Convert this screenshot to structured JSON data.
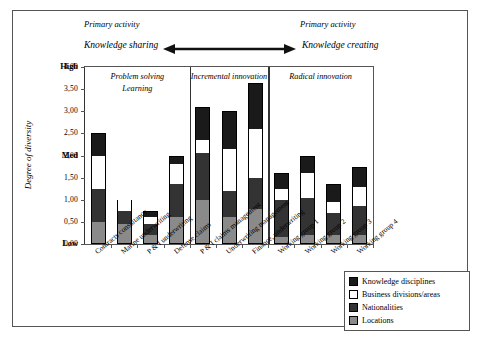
{
  "annotations": {
    "primary_activity_left": "Primary activity",
    "primary_activity_right": "Primary activity",
    "knowledge_sharing": "Knowledge sharing",
    "knowledge_creating": "Knowledge creating",
    "arrow_icon": "double-headed-arrow-icon"
  },
  "chart_data": {
    "type": "bar",
    "stacked": true,
    "title": "",
    "xlabel": "",
    "ylabel": "Degree of diversity",
    "ylim": [
      0,
      4
    ],
    "ytick_values": [
      "0,00",
      "0,50",
      "1,00",
      "1,50",
      "2,00",
      "2,50",
      "3,00",
      "3,50",
      "4,00"
    ],
    "qualitative_ticks": [
      {
        "label": "High",
        "value": 4.0
      },
      {
        "label": "Med",
        "value": 2.0
      },
      {
        "label": "Low",
        "value": 0.0
      }
    ],
    "grid": false,
    "legend_position": "bottom-right",
    "categories": [
      "Contracts consultancy",
      "Marine underwriting",
      "P & I underwriting",
      "Defense claims",
      "P & I claims management",
      "Underwriting management",
      "Finance, underwriting",
      "Working group 1",
      "Working group 2",
      "Working group 3",
      "Working group 4"
    ],
    "series": [
      {
        "name": "Locations",
        "color": "#8a8a8a",
        "values": [
          0.5,
          0.45,
          0.2,
          0.6,
          1.0,
          0.6,
          0.8,
          0.15,
          0.2,
          0.2,
          0.2
        ]
      },
      {
        "name": "Nationalities",
        "color": "#333333",
        "values": [
          0.75,
          0.3,
          0.25,
          0.75,
          1.05,
          0.6,
          0.7,
          0.85,
          0.85,
          0.5,
          0.65
        ]
      },
      {
        "name": "Business divisions/areas",
        "color": "#ffffff",
        "values": [
          0.75,
          0.25,
          0.15,
          0.45,
          0.3,
          0.95,
          1.1,
          0.25,
          0.55,
          0.25,
          0.45
        ]
      },
      {
        "name": "Knowledge disciplines",
        "color": "#1a1a1a",
        "values": [
          0.5,
          0.0,
          0.15,
          0.2,
          0.75,
          0.85,
          1.05,
          0.35,
          0.4,
          0.4,
          0.45
        ]
      }
    ],
    "totals": [
      2.5,
      1.0,
      0.75,
      2.0,
      3.1,
      3.0,
      3.65,
      1.6,
      2.0,
      1.35,
      1.75
    ],
    "regions": [
      {
        "label": "Problem solving",
        "label2": "Learning",
        "start_index": 0,
        "end_index": 3
      },
      {
        "label": "Incremental innovation",
        "label2": "",
        "start_index": 4,
        "end_index": 6
      },
      {
        "label": "Radical innovation",
        "label2": "",
        "start_index": 7,
        "end_index": 10
      }
    ]
  },
  "legend": {
    "items": [
      {
        "label": "Knowledge disciplines",
        "swatch": "sw-k"
      },
      {
        "label": "Business divisions/areas",
        "swatch": "sw-b"
      },
      {
        "label": "Nationalities",
        "swatch": "sw-n"
      },
      {
        "label": "Locations",
        "swatch": "sw-l"
      }
    ]
  }
}
